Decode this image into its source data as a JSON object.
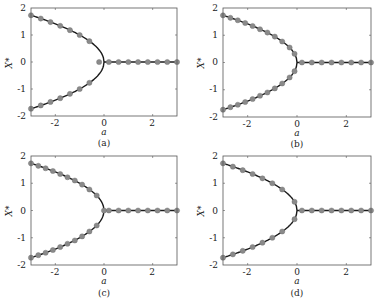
{
  "figure": {
    "layout": "2x2 grid of pitchfork bifurcation diagrams",
    "colors": {
      "curve": "#1a1a1a",
      "marker": "#8a8a8a",
      "frame": "#555555"
    }
  },
  "chart_data": [
    {
      "panel": "(a)",
      "type": "line",
      "xlabel": "a",
      "ylabel": "X*",
      "xlim": [
        -3,
        3
      ],
      "ylim": [
        -2,
        2
      ],
      "xticks": [
        "-2",
        "0",
        "2"
      ],
      "yticks": [
        "-2",
        "-1",
        "0",
        "1",
        "2"
      ],
      "grid": false,
      "series": [
        {
          "name": "upper branch (solid)",
          "curve": "sqrt(-a)",
          "x_range": [
            -3,
            0
          ]
        },
        {
          "name": "lower branch (solid)",
          "curve": "-sqrt(-a)",
          "x_range": [
            -3,
            0
          ]
        },
        {
          "name": "zero branch (solid)",
          "curve": "0",
          "x_range": [
            0,
            3
          ]
        },
        {
          "name": "markers upper",
          "x": [
            -3.0,
            -2.6,
            -2.2,
            -1.8,
            -1.4,
            -1.0,
            -0.6
          ],
          "y": [
            1.73,
            1.61,
            1.48,
            1.34,
            1.18,
            1.0,
            0.77
          ]
        },
        {
          "name": "markers lower",
          "x": [
            -3.0,
            -2.6,
            -2.2,
            -1.8,
            -1.4,
            -1.0,
            -0.6
          ],
          "y": [
            -1.73,
            -1.61,
            -1.48,
            -1.34,
            -1.18,
            -1.0,
            -0.77
          ]
        },
        {
          "name": "markers zero",
          "x": [
            -0.2,
            0.2,
            0.6,
            1.0,
            1.4,
            1.8,
            2.2,
            2.6,
            3.0
          ],
          "y": [
            0,
            0,
            0,
            0,
            0,
            0,
            0,
            0,
            0
          ]
        }
      ]
    },
    {
      "panel": "(b)",
      "type": "line",
      "xlabel": "a",
      "ylabel": "X*",
      "xlim": [
        -3,
        3
      ],
      "ylim": [
        -2,
        2
      ],
      "xticks": [
        "-2",
        "0",
        "2"
      ],
      "yticks": [
        "-2",
        "-1",
        "0",
        "1",
        "2"
      ],
      "grid": false,
      "series": [
        {
          "name": "upper branch (solid)",
          "curve": "sqrt(-a)",
          "x_range": [
            -3,
            0
          ]
        },
        {
          "name": "lower branch (solid)",
          "curve": "-sqrt(-a)",
          "x_range": [
            -3,
            0
          ]
        },
        {
          "name": "zero branch (solid)",
          "curve": "0",
          "x_range": [
            0,
            3
          ]
        },
        {
          "name": "markers upper",
          "x": [
            -3.0,
            -2.7,
            -2.4,
            -2.1,
            -1.8,
            -1.5,
            -1.2,
            -0.9,
            -0.6,
            -0.3,
            -0.1
          ],
          "y": [
            1.73,
            1.64,
            1.55,
            1.45,
            1.34,
            1.22,
            1.1,
            0.95,
            0.77,
            0.55,
            0.32
          ]
        },
        {
          "name": "markers lower",
          "x": [
            -3.0,
            -2.7,
            -2.4,
            -2.1,
            -1.8,
            -1.5,
            -1.2,
            -0.9,
            -0.6,
            -0.3,
            -0.1
          ],
          "y": [
            -1.73,
            -1.64,
            -1.55,
            -1.45,
            -1.34,
            -1.22,
            -1.1,
            -0.95,
            -0.77,
            -0.55,
            -0.32
          ]
        },
        {
          "name": "markers zero",
          "x": [
            0.2,
            0.6,
            1.0,
            1.4,
            1.8,
            2.2,
            2.6,
            3.0
          ],
          "y": [
            0,
            0,
            0,
            0,
            0,
            0,
            0,
            0
          ]
        }
      ]
    },
    {
      "panel": "(c)",
      "type": "line",
      "xlabel": "a",
      "ylabel": "X*",
      "xlim": [
        -3,
        3
      ],
      "ylim": [
        -2,
        2
      ],
      "xticks": [
        "-2",
        "0",
        "2"
      ],
      "yticks": [
        "-2",
        "-1",
        "0",
        "1",
        "2"
      ],
      "grid": false,
      "series": [
        {
          "name": "upper branch (solid)",
          "curve": "sqrt(-a)",
          "x_range": [
            -3,
            0
          ]
        },
        {
          "name": "lower branch (solid)",
          "curve": "-sqrt(-a)",
          "x_range": [
            -3,
            0
          ]
        },
        {
          "name": "zero branch (solid)",
          "curve": "0",
          "x_range": [
            0,
            3
          ]
        },
        {
          "name": "markers upper",
          "x": [
            -3.0,
            -2.7,
            -2.4,
            -2.1,
            -1.8,
            -1.5,
            -1.2,
            -0.9,
            -0.6,
            -0.3
          ],
          "y": [
            1.73,
            1.64,
            1.55,
            1.45,
            1.34,
            1.22,
            1.1,
            0.95,
            0.77,
            0.55
          ]
        },
        {
          "name": "markers lower",
          "x": [
            -3.0,
            -2.7,
            -2.4,
            -2.1,
            -1.8,
            -1.5,
            -1.2,
            -0.9,
            -0.6,
            -0.3
          ],
          "y": [
            -1.73,
            -1.64,
            -1.55,
            -1.45,
            -1.34,
            -1.22,
            -1.1,
            -0.95,
            -0.77,
            -0.55
          ]
        },
        {
          "name": "markers zero",
          "x": [
            0.0,
            0.2,
            0.6,
            1.0,
            1.4,
            1.8,
            2.2,
            2.6,
            3.0
          ],
          "y": [
            0,
            0,
            0,
            0,
            0,
            0,
            0,
            0,
            0
          ]
        }
      ]
    },
    {
      "panel": "(d)",
      "type": "line",
      "xlabel": "a",
      "ylabel": "X*",
      "xlim": [
        -3,
        3
      ],
      "ylim": [
        -2,
        2
      ],
      "xticks": [
        "-2",
        "0",
        "2"
      ],
      "yticks": [
        "-2",
        "-1",
        "0",
        "1",
        "2"
      ],
      "grid": false,
      "series": [
        {
          "name": "upper branch (solid)",
          "curve": "sqrt(-a)",
          "x_range": [
            -3,
            0
          ]
        },
        {
          "name": "lower branch (solid)",
          "curve": "-sqrt(-a)",
          "x_range": [
            -3,
            0
          ]
        },
        {
          "name": "zero branch (solid)",
          "curve": "0",
          "x_range": [
            0,
            3
          ]
        },
        {
          "name": "markers upper",
          "x": [
            -3.0,
            -2.6,
            -2.2,
            -1.8,
            -1.4,
            -1.0,
            -0.6,
            -0.1
          ],
          "y": [
            1.73,
            1.61,
            1.48,
            1.34,
            1.18,
            1.0,
            0.77,
            0.32
          ]
        },
        {
          "name": "markers lower",
          "x": [
            -3.0,
            -2.6,
            -2.2,
            -1.8,
            -1.4,
            -1.0,
            -0.6,
            -0.1
          ],
          "y": [
            -1.73,
            -1.61,
            -1.48,
            -1.34,
            -1.18,
            -1.0,
            -0.77,
            -0.32
          ]
        },
        {
          "name": "markers zero",
          "x": [
            0.2,
            0.6,
            1.0,
            1.4,
            1.8,
            2.2,
            2.6,
            3.0
          ],
          "y": [
            0,
            0,
            0,
            0,
            0,
            0,
            0,
            0
          ]
        }
      ]
    }
  ],
  "panels": [
    {
      "caption": "(a)",
      "xlabel": "a",
      "ylabel": "X*",
      "xticks": [
        "-2",
        "0",
        "2"
      ],
      "yticks": [
        "2",
        "1",
        "0",
        "-1",
        "-2"
      ]
    },
    {
      "caption": "(b)",
      "xlabel": "a",
      "ylabel": "X*",
      "xticks": [
        "-2",
        "0",
        "2"
      ],
      "yticks": [
        "2",
        "1",
        "0",
        "-1",
        "-2"
      ]
    },
    {
      "caption": "(c)",
      "xlabel": "a",
      "ylabel": "X*",
      "xticks": [
        "-2",
        "0",
        "2"
      ],
      "yticks": [
        "2",
        "1",
        "0",
        "-1",
        "-2"
      ]
    },
    {
      "caption": "(d)",
      "xlabel": "a",
      "ylabel": "X*",
      "xticks": [
        "-2",
        "0",
        "2"
      ],
      "yticks": [
        "2",
        "1",
        "0",
        "-1",
        "-2"
      ]
    }
  ]
}
